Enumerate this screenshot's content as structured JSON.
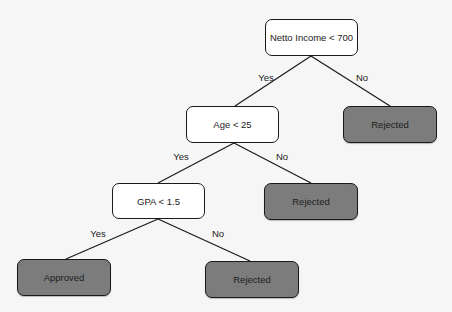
{
  "diagram": {
    "type": "decision-tree",
    "colors": {
      "background": "#f6f6f6",
      "decision_fill": "#ffffff",
      "leaf_fill": "#7c7c7c",
      "stroke": "#1a1a1a"
    },
    "nodes": [
      {
        "id": "root",
        "label": "Netto Income < 700",
        "kind": "decision",
        "x": 265,
        "y": 19,
        "w": 93,
        "h": 37
      },
      {
        "id": "age",
        "label": "Age < 25",
        "kind": "decision",
        "x": 186,
        "y": 106,
        "w": 93,
        "h": 37
      },
      {
        "id": "rej1",
        "label": "Rejected",
        "kind": "leaf",
        "x": 343,
        "y": 106,
        "w": 94,
        "h": 37
      },
      {
        "id": "gpa",
        "label": "GPA < 1.5",
        "kind": "decision",
        "x": 112,
        "y": 183,
        "w": 93,
        "h": 36
      },
      {
        "id": "rej2",
        "label": "Rejected",
        "kind": "leaf",
        "x": 264,
        "y": 183,
        "w": 94,
        "h": 37
      },
      {
        "id": "approved",
        "label": "Approved",
        "kind": "leaf",
        "x": 17,
        "y": 259,
        "w": 94,
        "h": 37
      },
      {
        "id": "rej3",
        "label": "Rejected",
        "kind": "leaf",
        "x": 205,
        "y": 261,
        "w": 94,
        "h": 37
      }
    ],
    "edges": [
      {
        "from": "root",
        "to": "age",
        "label": "Yes",
        "x1": 311,
        "y1": 56,
        "x2": 235,
        "y2": 106,
        "lx": 266,
        "ly": 77
      },
      {
        "from": "root",
        "to": "rej1",
        "label": "No",
        "x1": 311,
        "y1": 56,
        "x2": 390,
        "y2": 106,
        "lx": 362,
        "ly": 77
      },
      {
        "from": "age",
        "to": "gpa",
        "label": "Yes",
        "x1": 234,
        "y1": 143,
        "x2": 158,
        "y2": 183,
        "lx": 181,
        "ly": 156
      },
      {
        "from": "age",
        "to": "rej2",
        "label": "No",
        "x1": 234,
        "y1": 143,
        "x2": 311,
        "y2": 183,
        "lx": 282,
        "ly": 156
      },
      {
        "from": "gpa",
        "to": "approved",
        "label": "Yes",
        "x1": 158,
        "y1": 219,
        "x2": 66,
        "y2": 259,
        "lx": 98,
        "ly": 233
      },
      {
        "from": "gpa",
        "to": "rej3",
        "label": "No",
        "x1": 158,
        "y1": 219,
        "x2": 250,
        "y2": 261,
        "lx": 218,
        "ly": 233
      }
    ]
  }
}
